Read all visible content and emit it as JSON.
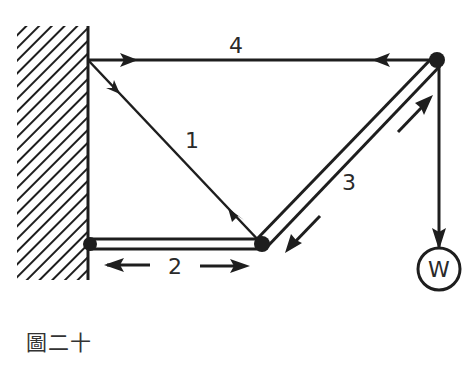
{
  "figure": {
    "caption": "圖二十",
    "members": [
      {
        "id": "1",
        "label": "1",
        "type": "tie",
        "from": "wall-top",
        "to": "joint-bottom"
      },
      {
        "id": "2",
        "label": "2",
        "type": "strut",
        "from": "wall-bottom",
        "to": "joint-bottom"
      },
      {
        "id": "3",
        "label": "3",
        "type": "strut",
        "from": "joint-bottom",
        "to": "joint-top-right"
      },
      {
        "id": "4",
        "label": "4",
        "type": "tie",
        "from": "wall-top",
        "to": "joint-top-right"
      }
    ],
    "load": {
      "label": "W"
    },
    "colors": {
      "ink": "#1e1e1e",
      "background": "#ffffff"
    }
  }
}
